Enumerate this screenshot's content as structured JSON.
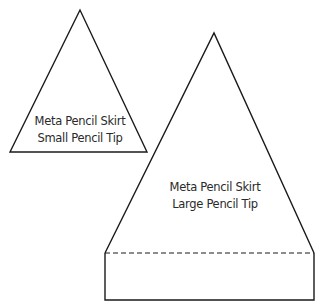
{
  "small_template": {
    "line1": "Meta Pencil Skirt",
    "line2": "Small Pencil Tip"
  },
  "large_template": {
    "line1": "Meta Pencil Skirt",
    "line2": "Large Pencil Tip"
  },
  "colors": {
    "stroke": "#1a1a1a",
    "background": "#ffffff"
  }
}
